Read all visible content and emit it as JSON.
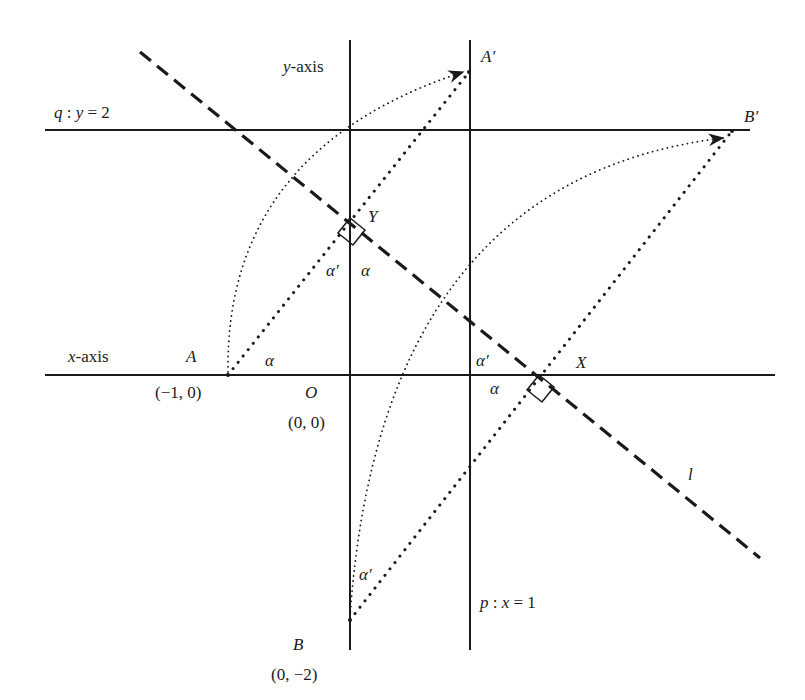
{
  "diagram": {
    "colors": {
      "ink": "#1a1a1a",
      "background": "#ffffff"
    },
    "lines": {
      "y_axis": {
        "label": "y-axis",
        "x1": 350,
        "y1": 40,
        "x2": 350,
        "y2": 650
      },
      "p": {
        "label": "p: x = 1",
        "x1": 470,
        "y1": 40,
        "x2": 470,
        "y2": 650
      },
      "q": {
        "label": "q: y = 2",
        "x1": 45,
        "y1": 130,
        "x2": 750,
        "y2": 130
      },
      "x_axis": {
        "label": "x-axis",
        "x1": 45,
        "y1": 375,
        "x2": 775,
        "y2": 375
      },
      "l": {
        "label": "l",
        "x1": 140,
        "y1": 52,
        "x2": 760,
        "y2": 558,
        "style": "dashed"
      }
    },
    "points": {
      "A": {
        "name": "A",
        "coords": "(−1, 0)",
        "px": 228,
        "py": 375
      },
      "A_prime": {
        "name": "A′",
        "px": 469,
        "py": 72
      },
      "B": {
        "name": "B",
        "coords": "(0, −2)",
        "px": 350,
        "py": 620
      },
      "B_prime": {
        "name": "B′",
        "px": 732,
        "py": 131
      },
      "O": {
        "name": "O",
        "coords": "(0, 0)",
        "px": 350,
        "py": 375
      },
      "X": {
        "name": "X",
        "px": 539,
        "py": 375
      },
      "Y": {
        "name": "Y",
        "px": 350,
        "py": 218
      }
    },
    "segments": [
      {
        "from": "A",
        "to": "A_prime",
        "style": "dotted"
      },
      {
        "from": "B",
        "to": "B_prime",
        "style": "dotted"
      }
    ],
    "arcs": [
      {
        "from": "A",
        "to": "A_prime",
        "style": "fine-dotted",
        "arrow": true
      },
      {
        "from": "B",
        "to": "B_prime",
        "style": "fine-dotted",
        "arrow": true
      }
    ],
    "angles": {
      "alpha": "α",
      "alpha_prime": "α′"
    },
    "right_angles": [
      "Y",
      "X"
    ]
  }
}
